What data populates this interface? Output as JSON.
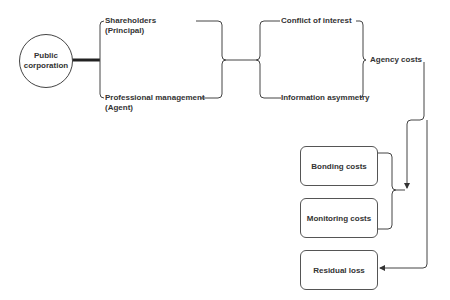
{
  "diagram": {
    "root": {
      "line1": "Public",
      "line2": "corporation"
    },
    "parties": [
      {
        "line1": "Shareholders",
        "line2": "(Principal)"
      },
      {
        "line1": "Professional management",
        "line2": "(Agent)"
      }
    ],
    "problems": [
      {
        "label": "Conflict of interest"
      },
      {
        "label": "Information asymmetry"
      }
    ],
    "result": {
      "label": "Agency costs"
    },
    "cost_components": [
      {
        "label": "Bonding costs"
      },
      {
        "label": "Monitoring costs"
      },
      {
        "label": "Residual loss"
      }
    ],
    "colors": {
      "line": "#444444",
      "text": "#333333",
      "background": "#ffffff"
    }
  }
}
